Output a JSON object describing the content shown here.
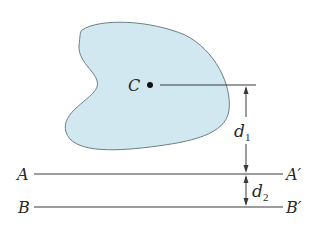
{
  "diagram": {
    "type": "parallel-axis-theorem",
    "colors": {
      "area_fill": "#d2e8f1",
      "area_stroke": "#6b7f88",
      "line": "#3a3a3a",
      "text": "#2a2a2a"
    },
    "centroid": {
      "label": "C"
    },
    "axes": [
      {
        "start_label": "A",
        "end_label": "A′"
      },
      {
        "start_label": "B",
        "end_label": "B′"
      }
    ],
    "dimensions": [
      {
        "label": "d",
        "subscript": "1"
      },
      {
        "label": "d",
        "subscript": "2"
      }
    ]
  }
}
